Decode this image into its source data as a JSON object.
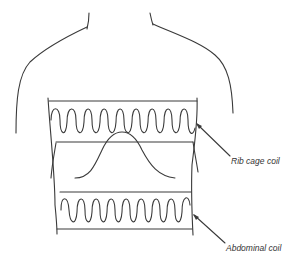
{
  "diagram": {
    "type": "respiratory inductance plethysmography illustration",
    "labels": {
      "rib_cage_coil": "Rib cage coil",
      "abdominal_coil": "Abdominal coil"
    },
    "elements": [
      {
        "name": "torso-outline",
        "description": "line drawing of neck, shoulders and torso"
      },
      {
        "name": "rib-cage-coil",
        "description": "sinusoidal wire coil band around chest",
        "loops": 9
      },
      {
        "name": "abdominal-coil",
        "description": "sinusoidal wire coil band around abdomen",
        "loops": 9
      },
      {
        "name": "waveform",
        "description": "bell-shaped curve between the two coils"
      }
    ],
    "colors": {
      "line": "#3a3a3a",
      "background": "#ffffff",
      "text": "#333333"
    }
  }
}
